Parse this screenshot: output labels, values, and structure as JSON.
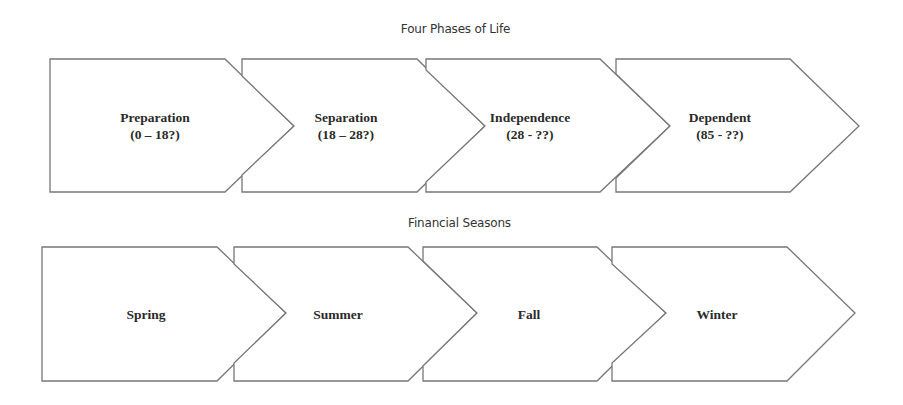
{
  "diagrams": [
    {
      "title": "Four Phases of Life",
      "stages": [
        {
          "name": "Preparation",
          "range": "(0 – 18?)"
        },
        {
          "name": "Separation",
          "range": "(18 – 28?)"
        },
        {
          "name": "Independence",
          "range": "(28 - ??)"
        },
        {
          "name": "Dependent",
          "range": "(85 - ??)"
        }
      ]
    },
    {
      "title": "Financial Seasons",
      "stages": [
        {
          "name": "Spring"
        },
        {
          "name": "Summer"
        },
        {
          "name": "Fall"
        },
        {
          "name": "Winter"
        }
      ]
    }
  ],
  "colors": {
    "stroke": "#777777",
    "fill": "#ffffff",
    "text": "#2a2a2a"
  }
}
